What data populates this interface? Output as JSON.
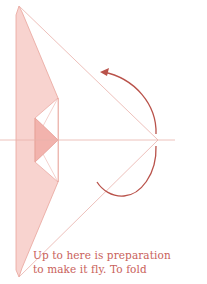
{
  "diagram": {
    "colors": {
      "fill_light": "#f8d3cf",
      "fill_dark": "#f2b3ad",
      "line": "#e8a49c",
      "arrow": "#b9524a",
      "centerline": "#e9b2ab"
    },
    "arrow": "fold-over-arrow"
  },
  "caption": {
    "line1": "Up to here is preparation",
    "line2": "to make it fly.  To fold"
  }
}
